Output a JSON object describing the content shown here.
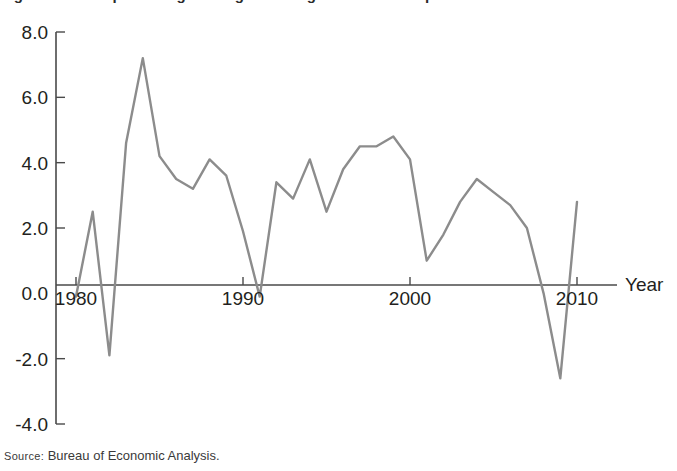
{
  "figure": {
    "title_clipped": "Figure: Annual percentage change in real gross domestic product",
    "source_prefix": "Source:",
    "source_text": "Bureau of Economic Analysis."
  },
  "axes": {
    "x_axis_name": "Year",
    "y_tick_labels": [
      "8.0",
      "6.0",
      "4.0",
      "2.0",
      "0.0",
      "-2.0",
      "-4.0"
    ],
    "x_tick_labels": [
      "1980",
      "1990",
      "2000",
      "2010"
    ]
  },
  "colors": {
    "line": "#8c8c8c",
    "axis": "#4a4a4a",
    "text": "#231f20",
    "background": "#ffffff"
  },
  "chart_data": {
    "type": "line",
    "title": "Annual percentage change in real gross domestic product",
    "xlabel": "Year",
    "ylabel": "",
    "xlim": [
      1980,
      2010
    ],
    "ylim": [
      -4.0,
      8.0
    ],
    "grid": false,
    "legend": "none",
    "y_ticks": [
      8.0,
      6.0,
      4.0,
      2.0,
      0.0,
      -2.0,
      -4.0
    ],
    "x_ticks": [
      1980,
      1990,
      2000,
      2010
    ],
    "series": [
      {
        "name": "Real GDP growth",
        "color": "#8c8c8c",
        "x": [
          1980,
          1981,
          1982,
          1983,
          1984,
          1985,
          1986,
          1987,
          1988,
          1989,
          1990,
          1991,
          1992,
          1993,
          1994,
          1995,
          1996,
          1997,
          1998,
          1999,
          2000,
          2001,
          2002,
          2003,
          2004,
          2005,
          2006,
          2007,
          2008,
          2009,
          2010
        ],
        "values": [
          -0.1,
          2.5,
          -1.9,
          4.6,
          7.2,
          4.2,
          3.5,
          3.2,
          4.1,
          3.6,
          1.9,
          -0.1,
          3.4,
          2.9,
          4.1,
          2.5,
          3.8,
          4.5,
          4.5,
          4.8,
          4.1,
          1.0,
          1.8,
          2.8,
          3.5,
          3.1,
          2.7,
          2.0,
          0.0,
          -2.6,
          2.8
        ]
      }
    ]
  }
}
